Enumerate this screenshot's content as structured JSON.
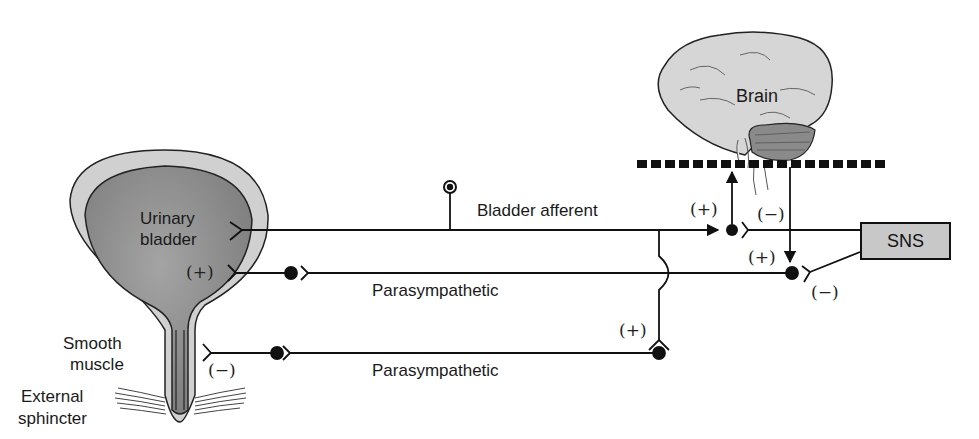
{
  "diagram": {
    "labels": {
      "brain": "Brain",
      "urinary_bladder_line1": "Urinary",
      "urinary_bladder_line2": "bladder",
      "smooth_muscle_line1": "Smooth",
      "smooth_muscle_line2": "muscle",
      "external_sphincter_line1": "External",
      "external_sphincter_line2": "sphincter",
      "bladder_afferent": "Bladder afferent",
      "parasympathetic_upper": "Parasympathetic",
      "parasympathetic_lower": "Parasympathetic",
      "sns": "SNS"
    },
    "signs": {
      "bladder_plus": "(+)",
      "sphincter_minus": "(−)",
      "afferent_to_brain_plus": "(+)",
      "brain_to_sns_minus": "(−)",
      "brain_to_para_plus": "(+)",
      "sns_to_para_minus": "(−)",
      "afferent_to_lower_plus": "(+)"
    },
    "colors": {
      "bladder_lumen": "#8f8f8f",
      "bladder_wall": "#d0d0d0",
      "brain": "#d6d6d6",
      "cerebellum": "#8a8a8a",
      "sns_box": "#c8c8c8",
      "line": "#111111"
    }
  }
}
